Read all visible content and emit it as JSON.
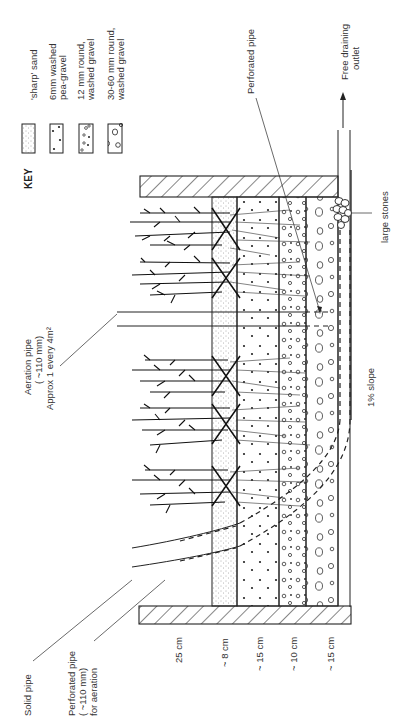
{
  "diagram": {
    "key": {
      "heading": "KEY",
      "items": [
        {
          "id": "sand",
          "line1": "'sharp' sand",
          "line2": ""
        },
        {
          "id": "pea-gravel",
          "line1": "6mm washed",
          "line2": "pea-gravel"
        },
        {
          "id": "round-gravel-12",
          "line1": "12 mm round,",
          "line2": "washed gravel"
        },
        {
          "id": "round-gravel-30-60",
          "line1": "30-60 mm round,",
          "line2": "washed gravel"
        }
      ]
    },
    "labels": {
      "perforated_pipe": "Perforated pipe",
      "outlet_line1": "Free draining",
      "outlet_line2": "outlet",
      "aeration_line1": "Aeration pipe",
      "aeration_line2": "( ~110 mm)",
      "aeration_line3": "Approx 1 every 4m²",
      "large_stones": "large stones",
      "slope": "1% slope",
      "solid_pipe": "Solid pipe",
      "perf_aeration_line1": "Perforated pipe",
      "perf_aeration_line2": "( ~110 mm)",
      "perf_aeration_line3": "for aeration"
    },
    "layer_depths": [
      {
        "label": "25 cm",
        "layer": "freeboard"
      },
      {
        "label": "~ 8 cm",
        "layer": "'sharp' sand"
      },
      {
        "label": "~ 15 cm",
        "layer": "6mm washed pea-gravel"
      },
      {
        "label": "~ 10 cm",
        "layer": "12 mm round, washed gravel"
      },
      {
        "label": "~ 15 cm",
        "layer": "30-60 mm round, washed gravel"
      }
    ]
  }
}
